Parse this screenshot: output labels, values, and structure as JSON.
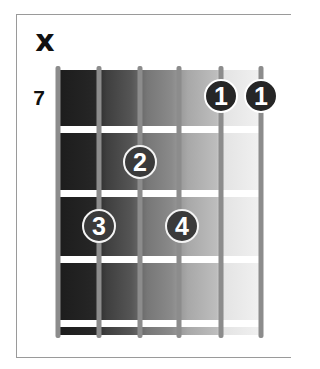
{
  "diagram": {
    "type": "guitar-chord-diagram",
    "muted_marker": "x",
    "starting_fret": "7",
    "strings": 6,
    "frets_shown": 4,
    "string_x": [
      58,
      99,
      140,
      179,
      221,
      261
    ],
    "fret_line_y": [
      129,
      193,
      259,
      323
    ],
    "colors": {
      "fretboard_dark": "#1c1c1c",
      "fretboard_light": "#f1f1f1",
      "string": "#8c8c8c",
      "fret_line": "#ffffff",
      "dot_fill": "#3a3a3a",
      "dot_border": "#f4f4f4",
      "dot_text": "#ffffff",
      "frame_border": "#9a9a9a"
    },
    "fingers": [
      {
        "label": "1",
        "string": 5,
        "fret": 1,
        "x": 221,
        "y": 96
      },
      {
        "label": "1",
        "string": 6,
        "fret": 1,
        "x": 261,
        "y": 96
      },
      {
        "label": "2",
        "string": 3,
        "fret": 2,
        "x": 140,
        "y": 162
      },
      {
        "label": "3",
        "string": 2,
        "fret": 3,
        "x": 99,
        "y": 226
      },
      {
        "label": "4",
        "string": 4,
        "fret": 3,
        "x": 182,
        "y": 226
      }
    ]
  }
}
